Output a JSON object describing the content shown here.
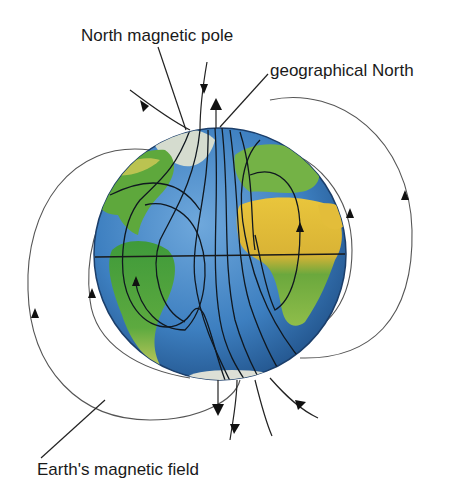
{
  "diagram": {
    "labels": {
      "north_magnetic_pole": "North magnetic pole",
      "geographical_north": "geographical North",
      "earths_magnetic_field": "Earth's magnetic field"
    },
    "colors": {
      "ocean": "#3d7fc0",
      "ocean_dark": "#23558f",
      "land_green": "#5aa63a",
      "land_yellow": "#e8c33a",
      "ice": "#d9ded8",
      "field_line": "#222222",
      "text": "#1a1a1a"
    }
  }
}
